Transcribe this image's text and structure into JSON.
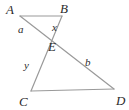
{
  "figure": {
    "canvas": {
      "width": 129,
      "height": 110
    },
    "stroke_color": "#9a9a9a",
    "label_color": "#2b2b2b",
    "background_color": "#ffffff",
    "vertices": [
      {
        "name": "A",
        "label": "A",
        "x": 20,
        "y": 16,
        "label_x": 6,
        "label_y": 3
      },
      {
        "name": "B",
        "label": "B",
        "x": 62,
        "y": 16,
        "label_x": 60,
        "label_y": 2
      },
      {
        "name": "E",
        "label": "E",
        "x": 48,
        "y": 37,
        "label_x": 48,
        "label_y": 40
      },
      {
        "name": "C",
        "label": "C",
        "x": 31,
        "y": 91,
        "label_x": 19,
        "label_y": 95
      },
      {
        "name": "D",
        "label": "D",
        "x": 114,
        "y": 89,
        "label_x": 116,
        "label_y": 94
      }
    ],
    "segments": [
      {
        "name": "segment-AB",
        "from": "A",
        "to": "B",
        "x1": 20,
        "y1": 16,
        "x2": 62,
        "y2": 16
      },
      {
        "name": "segment-AD",
        "from": "A",
        "to": "D",
        "x1": 20,
        "y1": 16,
        "x2": 114,
        "y2": 89
      },
      {
        "name": "segment-BC",
        "from": "B",
        "to": "C",
        "x1": 62,
        "y1": 16,
        "x2": 31,
        "y2": 91
      },
      {
        "name": "segment-CD",
        "from": "C",
        "to": "D",
        "x1": 31,
        "y1": 91,
        "x2": 114,
        "y2": 89
      }
    ],
    "segment_labels": [
      {
        "name": "label-a",
        "text": "a",
        "x": 18,
        "y": 24,
        "belongs_to": "segment-AD",
        "part": "AE"
      },
      {
        "name": "label-x",
        "text": "x",
        "x": 52,
        "y": 22,
        "belongs_to": "segment-BC",
        "part": "BE"
      },
      {
        "name": "label-y",
        "text": "y",
        "x": 24,
        "y": 60,
        "belongs_to": "segment-BC",
        "part": "EC"
      },
      {
        "name": "label-b",
        "text": "b",
        "x": 85,
        "y": 57,
        "belongs_to": "segment-AD",
        "part": "ED"
      }
    ]
  }
}
